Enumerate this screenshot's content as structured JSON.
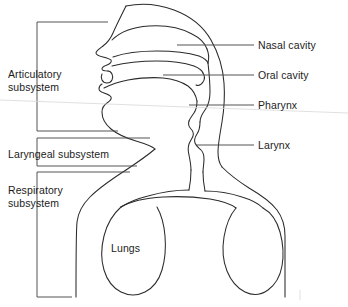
{
  "figure": {
    "kind": "anatomical-line-diagram",
    "background_color": "#ffffff",
    "line_color": "#2b2b2b",
    "leader_color": "#4a4a4a",
    "text_color": "#1c1c1c"
  },
  "organ_labels": [
    {
      "id": "nasal-cavity",
      "text": "Nasal cavity",
      "side": "right",
      "x": 258,
      "y": 39,
      "leader": {
        "x1": 177,
        "y1": 45,
        "x2": 254,
        "y2": 45
      }
    },
    {
      "id": "oral-cavity",
      "text": "Oral cavity",
      "side": "right",
      "x": 258,
      "y": 69,
      "leader": {
        "x1": 163,
        "y1": 75,
        "x2": 254,
        "y2": 75
      }
    },
    {
      "id": "pharynx",
      "text": "Pharynx",
      "side": "right",
      "x": 258,
      "y": 99,
      "leader": {
        "x1": 189,
        "y1": 105,
        "x2": 254,
        "y2": 105
      }
    },
    {
      "id": "larynx",
      "text": "Larynx",
      "side": "right",
      "x": 258,
      "y": 139,
      "leader": {
        "x1": 196,
        "y1": 145,
        "x2": 254,
        "y2": 145
      }
    }
  ],
  "subsystem_labels": [
    {
      "id": "articulatory-subsystem",
      "text": "Articulatory\nsubsystem",
      "side": "left",
      "x": 8,
      "y": 68,
      "bracket": {
        "x": 37,
        "y_top": 22,
        "y_bottom": 131,
        "arm_top_x2": 108,
        "arm_bottom_x2": 118
      }
    },
    {
      "id": "laryngeal-subsystem",
      "text": "Laryngeal subsystem",
      "side": "left",
      "x": 8,
      "y": 148,
      "bracket": {
        "x": 37,
        "y_top": 138,
        "y_bottom": 166,
        "arm_top_x2": 150,
        "arm_bottom_x2": 137
      }
    },
    {
      "id": "respiratory-subsystem",
      "text": "Respiratory\nsubsystem",
      "side": "left",
      "x": 8,
      "y": 184,
      "bracket": {
        "x": 37,
        "y_top": 172,
        "y_bottom": 297,
        "arm_top_x2": 130,
        "arm_bottom_x2": 72
      }
    }
  ],
  "inline_labels": [
    {
      "id": "lungs",
      "text": "Lungs",
      "x": 111,
      "y": 242
    }
  ]
}
